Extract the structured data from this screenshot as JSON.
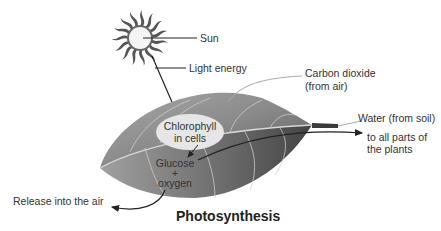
{
  "diagram": {
    "title": "Photosynthesis",
    "labels": {
      "sun": "Sun",
      "light_energy": "Light energy",
      "carbon_dioxide_line1": "Carbon dioxide",
      "carbon_dioxide_line2": "(from air)",
      "chlorophyll_line1": "Chlorophyll",
      "chlorophyll_line2": "in cells",
      "water": "Water (from soil)",
      "to_all_parts_line1": "to all parts of",
      "to_all_parts_line2": "the plants",
      "glucose": "Glucose",
      "plus": "+",
      "oxygen": "oxygen",
      "release": "Release into the air"
    },
    "icons": [
      "sun-icon",
      "leaf-illustration"
    ],
    "colors": {
      "leaf_light": "#b8b8b8",
      "leaf_dark": "#4a4a4a",
      "chlorophyll_ellipse": "#e6e6e6",
      "arrow": "#222222"
    }
  }
}
